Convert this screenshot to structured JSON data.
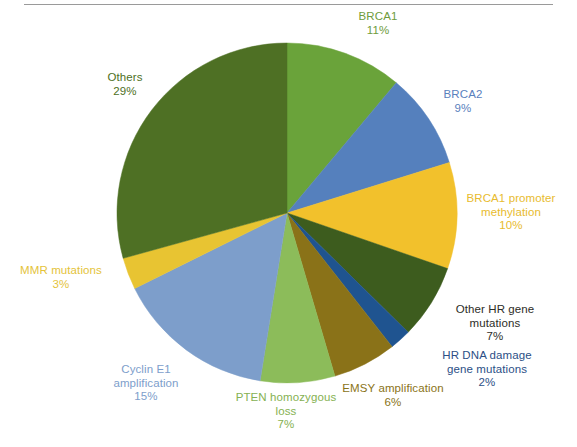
{
  "figure": {
    "background_color": "#ffffff",
    "rule_color": "#9a9a9a"
  },
  "chart_data": {
    "type": "pie",
    "title": "",
    "subtitle": "",
    "xlabel": "",
    "ylabel": "",
    "legend_position": "outside-labels",
    "grid": false,
    "total_percent": 100,
    "start_angle_deg": 0,
    "direction": "clockwise",
    "categories": [
      "BRCA1",
      "BRCA2",
      "BRCA1 promoter methylation",
      "Other HR gene mutations",
      "HR DNA damage gene mutations",
      "EMSY amplification",
      "PTEN homozygous loss",
      "Cyclin E1 amplification",
      "MMR mutations",
      "Others"
    ],
    "values": [
      11,
      9,
      10,
      7,
      2,
      6,
      7,
      15,
      3,
      29
    ],
    "value_labels": [
      "11%",
      "9%",
      "10%",
      "7%",
      "2%",
      "6%",
      "7%",
      "15%",
      "3%",
      "29%"
    ],
    "colors": [
      "#6aa33a",
      "#5580bd",
      "#f2c12c",
      "#3d5c1e",
      "#1f5490",
      "#8a7218",
      "#8cbc5a",
      "#7d9ecb",
      "#e8c432",
      "#4e7024"
    ],
    "slices": [
      {
        "name": "BRCA1",
        "label_line1": "BRCA1",
        "percent_label": "11%",
        "value": 11,
        "color": "#6aa33a",
        "text_color": "#6f9c3c"
      },
      {
        "name": "BRCA2",
        "label_line1": "BRCA2",
        "percent_label": "9%",
        "value": 9,
        "color": "#5580bd",
        "text_color": "#5a81bd"
      },
      {
        "name": "BRCA1 promoter methylation",
        "label_line1": "BRCA1 promoter",
        "label_line2": "methylation",
        "percent_label": "10%",
        "value": 10,
        "color": "#f2c12c",
        "text_color": "#e8bb2e"
      },
      {
        "name": "Other HR gene mutations",
        "label_line1": "Other HR gene",
        "label_line2": "mutations",
        "percent_label": "7%",
        "value": 7,
        "color": "#3d5c1e",
        "text_color": "#2d2d27"
      },
      {
        "name": "HR DNA damage gene mutations",
        "label_line1": "HR DNA damage",
        "label_line2": "gene mutations",
        "percent_label": "2%",
        "value": 2,
        "color": "#1f5490",
        "text_color": "#2c4f86"
      },
      {
        "name": "EMSY amplification",
        "label_line1": "EMSY amplification",
        "percent_label": "6%",
        "value": 6,
        "color": "#8a7218",
        "text_color": "#8a7318"
      },
      {
        "name": "PTEN homozygous loss",
        "label_line1": "PTEN homozygous",
        "label_line2": "loss",
        "percent_label": "7%",
        "value": 7,
        "color": "#8cbc5a",
        "text_color": "#85b152"
      },
      {
        "name": "Cyclin E1 amplification",
        "label_line1": "Cyclin E1",
        "label_line2": "amplification",
        "percent_label": "15%",
        "value": 15,
        "color": "#7d9ecb",
        "text_color": "#7d9ecb"
      },
      {
        "name": "MMR mutations",
        "label_line1": "MMR mutations",
        "percent_label": "3%",
        "value": 3,
        "color": "#e8c432",
        "text_color": "#e4c33a"
      },
      {
        "name": "Others",
        "label_line1": "Others",
        "percent_label": "29%",
        "value": 29,
        "color": "#4e7024",
        "text_color": "#4e7024"
      }
    ]
  }
}
